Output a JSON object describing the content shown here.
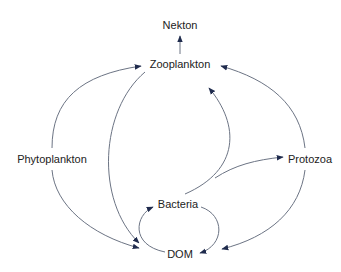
{
  "diagram": {
    "type": "food-web",
    "colors": {
      "edge": "#6c7484",
      "arrowhead": "#1f2b4d",
      "text": "#222222",
      "background": "#ffffff"
    },
    "nodes": {
      "nekton": {
        "label": "Nekton",
        "x": 180,
        "y": 25
      },
      "zooplankton": {
        "label": "Zooplankton",
        "x": 180,
        "y": 64
      },
      "phytoplankton": {
        "label": "Phytoplankton",
        "x": 52,
        "y": 159
      },
      "protozoa": {
        "label": "Protozoa",
        "x": 310,
        "y": 159
      },
      "bacteria": {
        "label": "Bacteria",
        "x": 178,
        "y": 204
      },
      "dom": {
        "label": "DOM",
        "x": 180,
        "y": 254
      }
    },
    "edges": [
      {
        "from": "zooplankton",
        "to": "nekton"
      },
      {
        "from": "phytoplankton",
        "to": "zooplankton"
      },
      {
        "from": "phytoplankton",
        "to": "dom"
      },
      {
        "from": "zooplankton",
        "to": "dom"
      },
      {
        "from": "bacteria",
        "to": "zooplankton"
      },
      {
        "from": "bacteria",
        "to": "protozoa"
      },
      {
        "from": "protozoa",
        "to": "zooplankton"
      },
      {
        "from": "protozoa",
        "to": "dom"
      },
      {
        "from": "dom",
        "to": "bacteria"
      },
      {
        "from": "bacteria",
        "to": "dom"
      }
    ]
  }
}
